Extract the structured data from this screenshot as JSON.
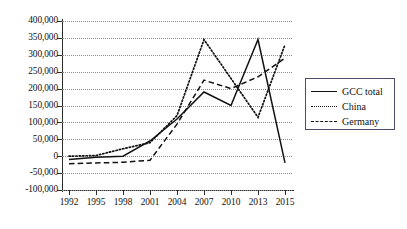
{
  "chart_data": {
    "type": "line",
    "title": "",
    "xlabel": "",
    "ylabel": "",
    "x": [
      1992,
      1995,
      1998,
      2001,
      2004,
      2007,
      2010,
      2013,
      2015
    ],
    "xtick_labels": [
      "1992",
      "1995",
      "1998",
      "2001",
      "2004",
      "2007",
      "2010",
      "2013",
      "2015"
    ],
    "ytick_labels": [
      "400,000",
      "350,000",
      "300,000",
      "250,000",
      "200,000",
      "150,000",
      "100,000",
      "50,000",
      "0",
      "-50,000",
      "-100,000"
    ],
    "ytick_values": [
      400000,
      350000,
      300000,
      250000,
      200000,
      150000,
      100000,
      50000,
      0,
      -50000,
      -100000
    ],
    "ylim": [
      -100000,
      400000
    ],
    "grid": true,
    "legend_position": "right",
    "series": [
      {
        "name": "GCC total",
        "style": "solid",
        "values": [
          -10000,
          -3000,
          0,
          45000,
          110000,
          190000,
          150000,
          345000,
          -20000
        ]
      },
      {
        "name": "China",
        "style": "dotted",
        "values": [
          0,
          2000,
          22000,
          40000,
          120000,
          345000,
          230000,
          115000,
          330000
        ]
      },
      {
        "name": "Germany",
        "style": "dashed",
        "values": [
          -22000,
          -20000,
          -18000,
          -12000,
          95000,
          225000,
          200000,
          235000,
          290000
        ]
      }
    ]
  },
  "legend": {
    "items": [
      {
        "label": "GCC total",
        "style": "solid"
      },
      {
        "label": "China",
        "style": "dotted"
      },
      {
        "label": "Germany",
        "style": "dashed"
      }
    ]
  }
}
